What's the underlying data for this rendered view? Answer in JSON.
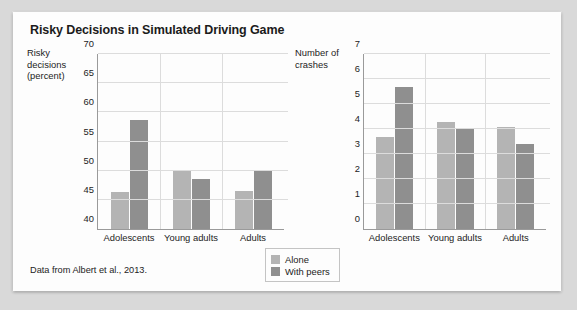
{
  "figure": {
    "title": "Risky Decisions in Simulated Driving Game",
    "source_note": "Data from Albert et al., 2013."
  },
  "legend": {
    "items": [
      {
        "label": "Alone",
        "color": "#b4b4b4"
      },
      {
        "label": "With peers",
        "color": "#8f8f8f"
      }
    ]
  },
  "chart_data": [
    {
      "type": "bar",
      "title": "Risky Decisions in Simulated Driving Game",
      "panel": "left",
      "ylabel": "Risky decisions (percent)",
      "ylabel_lines": [
        "Risky",
        "decisions",
        "(percent)"
      ],
      "xlabel": "",
      "categories": [
        "Adolescents",
        "Young adults",
        "Adults"
      ],
      "ylim": [
        40,
        70
      ],
      "yticks": [
        40,
        45,
        50,
        55,
        60,
        65,
        70
      ],
      "grid": true,
      "legend_position": "below-center",
      "series": [
        {
          "name": "Alone",
          "color": "#b4b4b4",
          "values": [
            46.3,
            50.1,
            46.5
          ]
        },
        {
          "name": "With peers",
          "color": "#8f8f8f",
          "values": [
            58.7,
            48.5,
            50.2
          ]
        }
      ]
    },
    {
      "type": "bar",
      "panel": "right",
      "ylabel": "Number of crashes",
      "ylabel_lines": [
        "Number of",
        "crashes"
      ],
      "xlabel": "",
      "categories": [
        "Adolescents",
        "Young adults",
        "Adults"
      ],
      "ylim": [
        0,
        7
      ],
      "yticks": [
        0,
        1,
        2,
        3,
        4,
        5,
        6,
        7
      ],
      "grid": true,
      "legend_position": "below-center",
      "series": [
        {
          "name": "Alone",
          "color": "#b4b4b4",
          "values": [
            3.7,
            4.3,
            4.1
          ]
        },
        {
          "name": "With peers",
          "color": "#8f8f8f",
          "values": [
            5.7,
            4.0,
            3.4
          ]
        }
      ]
    }
  ]
}
